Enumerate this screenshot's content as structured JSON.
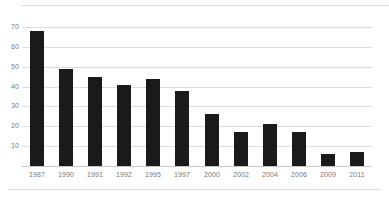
{
  "chart_data": {
    "type": "bar",
    "title": "",
    "subtitle": "",
    "xlabel": "",
    "ylabel": "",
    "categories": [
      "1987",
      "1990",
      "1991",
      "1992",
      "1995",
      "1997",
      "2000",
      "2002",
      "2004",
      "2006",
      "2009",
      "2011"
    ],
    "values": [
      68,
      49,
      45,
      41,
      44,
      38,
      26,
      17,
      21,
      17,
      6,
      7
    ],
    "ylim": [
      0,
      70
    ],
    "yticks": [
      10,
      20,
      30,
      40,
      50,
      60,
      70
    ],
    "ytick_labels": [
      "10",
      "20",
      "30",
      "40",
      "50",
      "60",
      "70"
    ],
    "grid": true,
    "grid_axis": "y",
    "legend": false,
    "legend_position": "none",
    "bar_color": "#1a1a1a",
    "gridline_color": "#dcdcdc",
    "axis_label_color": "#7a7a7a",
    "background_color": "#ffffff",
    "annotations": []
  }
}
